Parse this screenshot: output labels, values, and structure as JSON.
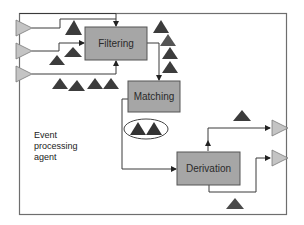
{
  "diagram": {
    "title": "Event processing agent",
    "agent_label": [
      "Event",
      "processing",
      "agent"
    ],
    "boxes": [
      {
        "id": "filtering",
        "label": "Filtering"
      },
      {
        "id": "matching",
        "label": "Matching"
      },
      {
        "id": "derivation",
        "label": "Derivation"
      }
    ],
    "input_channels": 3,
    "output_channels": 2,
    "colors": {
      "frame": "#6e6e6e",
      "box_fill": "#a6a6a6",
      "box_stroke": "#555555",
      "event_triangle": "#3c3c3c",
      "channel_triangle": "#c4c4c4",
      "line": "#3a3a3a"
    },
    "icons": {
      "event": "dark-triangle",
      "channel": "light-gray-right-pointing-triangle",
      "pattern": "ellipse-enclosing-two-events"
    }
  }
}
